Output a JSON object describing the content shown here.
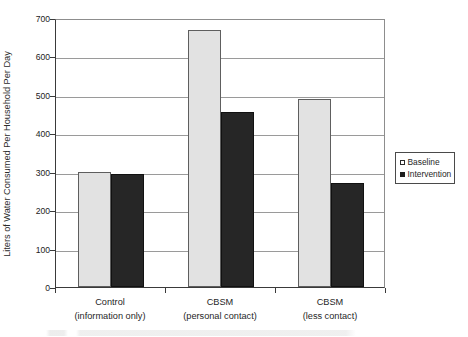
{
  "chart_data": {
    "type": "bar",
    "title": "",
    "xlabel": "",
    "ylabel": "Liters of Water Consumed Per Household Per Day",
    "ylim": [
      0,
      700
    ],
    "yticks": [
      0,
      100,
      200,
      300,
      400,
      500,
      600,
      700
    ],
    "grid": true,
    "legend_position": "right-outside",
    "categories": [
      {
        "line1": "Control",
        "line2": "(information only)"
      },
      {
        "line1": "CBSM",
        "line2": "(personal contact)"
      },
      {
        "line1": "CBSM",
        "line2": "(less contact)"
      }
    ],
    "category_labels": [
      "Control (information only)",
      "CBSM (personal contact)",
      "CBSM (less contact)"
    ],
    "series": [
      {
        "name": "Baseline",
        "color": "#e2e2e2",
        "values": [
          300,
          670,
          490
        ]
      },
      {
        "name": "Intervention",
        "color": "#262626",
        "values": [
          295,
          455,
          270
        ]
      }
    ]
  },
  "axis": {
    "y_tick_labels": [
      "700",
      "600",
      "500",
      "400",
      "300",
      "200",
      "100",
      "0"
    ]
  },
  "legend": {
    "items": [
      {
        "label": "Baseline",
        "swatch": "open-square-icon"
      },
      {
        "label": "Intervention",
        "swatch": "filled-square-icon"
      }
    ]
  },
  "colors": {
    "baseline_fill": "#e2e2e2",
    "baseline_stroke": "#5e5e5e",
    "intervention_fill": "#262626",
    "intervention_stroke": "#111111",
    "gridline": "#9a9a9a",
    "axis": "#3a3a3a",
    "background": "#ffffff"
  }
}
